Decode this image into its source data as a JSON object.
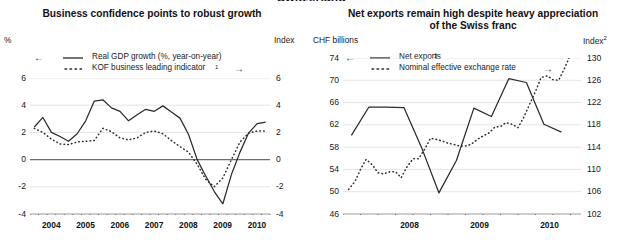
{
  "section_heading": "Switzerland",
  "left_panel": {
    "title": "Business confidence points to robust growth",
    "unit_left": "%",
    "unit_right": "Index",
    "legend": {
      "series1_label": "Real GDP growth (%, year-on-year)",
      "series2_label": "KOF business leading indicator",
      "series2_footnote": "1",
      "arrow_left": "←",
      "arrow_right": "→"
    }
  },
  "right_panel": {
    "title": "Net exports remain high despite heavy appreciation of the Swiss franc",
    "unit_left": "CHF billions",
    "unit_right": "Index",
    "unit_right_footnote": "2",
    "legend": {
      "series1_label": "Net exports",
      "series1_footnote": "3",
      "series2_label": "Nominal effective exchange rate",
      "arrow_left": "←",
      "arrow_right": "→"
    }
  },
  "chart_data": [
    {
      "type": "line",
      "title": "Business confidence points to robust growth",
      "xlabel": "",
      "ylabel": "%",
      "ylabel_right": "Index",
      "ylim": [
        -4,
        6
      ],
      "ylim_right": [
        -4,
        6
      ],
      "yticks": [
        6,
        4,
        2,
        0,
        -2,
        -4
      ],
      "yticks_right": [
        6,
        4,
        2,
        0,
        -2,
        -4
      ],
      "xlim": [
        2003.75,
        2010.75
      ],
      "xticks": [
        2004,
        2005,
        2006,
        2007,
        2008,
        2009,
        2010
      ],
      "xtick_labels": [
        "2004",
        "2005",
        "2006",
        "2007",
        "2008",
        "2009",
        "2010"
      ],
      "xtick_minor_step": 0.25,
      "grid": true,
      "zero_line": true,
      "legend_position": "top-left",
      "series": [
        {
          "name": "Real GDP growth (%, year-on-year)",
          "style": "solid",
          "axis": "left",
          "x": [
            2003.875,
            2004.125,
            2004.375,
            2004.625,
            2004.875,
            2005.125,
            2005.375,
            2005.625,
            2005.875,
            2006.125,
            2006.375,
            2006.625,
            2006.875,
            2007.125,
            2007.375,
            2007.625,
            2007.875,
            2008.125,
            2008.375,
            2008.625,
            2008.875,
            2009.125,
            2009.375,
            2009.625,
            2009.875,
            2010.125,
            2010.375,
            2010.625
          ],
          "values": [
            2.4,
            3.1,
            2.0,
            1.7,
            1.35,
            1.9,
            2.85,
            4.3,
            4.4,
            3.8,
            3.55,
            2.85,
            3.3,
            3.7,
            3.55,
            3.95,
            3.5,
            3.05,
            1.85,
            0.0,
            -1.2,
            -2.35,
            -3.25,
            -1.1,
            0.55,
            1.95,
            2.65,
            2.75
          ]
        },
        {
          "name": "KOF business leading indicator",
          "style": "dotted",
          "axis": "right",
          "x": [
            2003.875,
            2004.125,
            2004.375,
            2004.625,
            2004.875,
            2005.125,
            2005.375,
            2005.625,
            2005.875,
            2006.125,
            2006.375,
            2006.625,
            2006.875,
            2007.125,
            2007.375,
            2007.625,
            2007.875,
            2008.125,
            2008.375,
            2008.625,
            2008.875,
            2009.125,
            2009.375,
            2009.625,
            2009.875,
            2010.125,
            2010.375,
            2010.625
          ],
          "values": [
            2.3,
            2.0,
            1.5,
            1.15,
            1.1,
            1.3,
            1.35,
            1.4,
            2.3,
            2.05,
            1.6,
            1.45,
            1.6,
            2.0,
            2.1,
            1.9,
            1.4,
            0.95,
            0.55,
            -0.35,
            -1.45,
            -2.0,
            -1.35,
            0.0,
            1.3,
            1.95,
            2.1,
            2.1
          ]
        }
      ]
    },
    {
      "type": "line",
      "title": "Net exports remain high despite heavy appreciation of the Swiss franc",
      "xlabel": "",
      "ylabel": "CHF billions",
      "ylabel_right": "Index",
      "ylim": [
        46,
        74
      ],
      "ylim_right": [
        102,
        130
      ],
      "yticks": [
        74,
        70,
        66,
        62,
        58,
        54,
        50,
        46
      ],
      "yticks_right": [
        130,
        126,
        122,
        118,
        114,
        110,
        106,
        102
      ],
      "xlim": [
        2007.5,
        2010.9
      ],
      "xticks": [
        2008,
        2009,
        2010
      ],
      "xtick_labels": [
        "2008",
        "2009",
        "2010"
      ],
      "xtick_minor_step": 0.25,
      "grid": true,
      "zero_line": false,
      "legend_position": "top-left",
      "series": [
        {
          "name": "Net exports",
          "style": "solid",
          "axis": "left",
          "x": [
            2007.62,
            2007.87,
            2008.12,
            2008.37,
            2008.62,
            2008.87,
            2009.12,
            2009.37,
            2009.62,
            2009.87,
            2010.12,
            2010.37,
            2010.62
          ],
          "values": [
            60.1,
            65.2,
            65.2,
            65.1,
            58.0,
            49.8,
            55.6,
            65.0,
            63.5,
            70.3,
            69.6,
            62.1,
            60.7
          ]
        },
        {
          "name": "Nominal effective exchange rate",
          "style": "dotted",
          "axis": "right",
          "x": [
            2007.58,
            2007.67,
            2007.75,
            2007.83,
            2007.92,
            2008.0,
            2008.08,
            2008.17,
            2008.25,
            2008.33,
            2008.42,
            2008.5,
            2008.58,
            2008.67,
            2008.75,
            2008.83,
            2008.92,
            2009.0,
            2009.08,
            2009.17,
            2009.25,
            2009.33,
            2009.42,
            2009.5,
            2009.58,
            2009.67,
            2009.75,
            2009.83,
            2009.92,
            2010.0,
            2010.08,
            2010.17,
            2010.25,
            2010.33,
            2010.42,
            2010.5,
            2010.58,
            2010.67,
            2010.75,
            2010.83
          ],
          "values": [
            106.4,
            107.8,
            110.0,
            111.8,
            110.8,
            109.4,
            109.2,
            109.6,
            109.6,
            108.5,
            110.6,
            111.9,
            111.9,
            113.7,
            115.6,
            115.4,
            115.1,
            114.7,
            114.5,
            114.2,
            114.2,
            114.5,
            115.4,
            116.0,
            116.5,
            117.6,
            117.7,
            118.4,
            118.1,
            117.5,
            119.3,
            121.8,
            124.0,
            126.5,
            126.8,
            126.1,
            126.0,
            128.3,
            130.6,
            130.2
          ]
        }
      ]
    }
  ]
}
